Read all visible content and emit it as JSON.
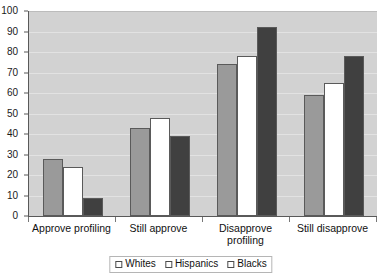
{
  "chart_data": {
    "type": "bar",
    "title": "",
    "subtitle": "",
    "xlabel": "",
    "ylabel": "",
    "ylim": [
      0,
      100
    ],
    "ytick_step": 10,
    "yticks": [
      0,
      10,
      20,
      30,
      40,
      50,
      60,
      70,
      80,
      90,
      100
    ],
    "grid": true,
    "grid_axis": "y",
    "legend_position": "bottom",
    "categories": [
      "Approve profiling",
      "Still approve",
      "Disapprove\nprofiling",
      "Still disapprove"
    ],
    "series": [
      {
        "name": "Whites",
        "color": "#9a9a9a",
        "values": [
          28,
          43,
          74,
          59
        ]
      },
      {
        "name": "Hispanics",
        "color": "#ffffff",
        "values": [
          24,
          48,
          78,
          65
        ]
      },
      {
        "name": "Blacks",
        "color": "#404040",
        "values": [
          9,
          39,
          92,
          78
        ]
      }
    ]
  },
  "legend": {
    "items": [
      {
        "label": "Whites",
        "swatch_class": "series-whites"
      },
      {
        "label": "Hispanics",
        "swatch_class": "series-hispanics"
      },
      {
        "label": "Blacks",
        "swatch_class": "series-blacks"
      }
    ]
  },
  "colors": {
    "plot_background": "#d2d2d2",
    "gridline": "#e2e2e2",
    "axis": "#595959",
    "bar_outline": "#5a5a5a",
    "text": "#111111",
    "page_background": "#ffffff"
  }
}
